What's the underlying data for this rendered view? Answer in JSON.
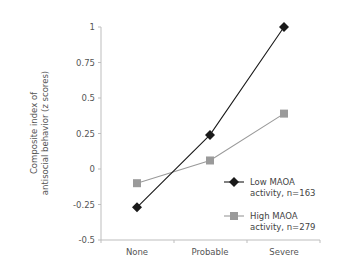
{
  "chart_data": {
    "type": "line",
    "title": "",
    "xlabel": "",
    "ylabel_lines": [
      "Composite index of",
      "antisocial behavior (z scores)"
    ],
    "ylabel": "Composite index of antisocial behavior (z scores)",
    "categories": [
      "None",
      "Probable",
      "Severe"
    ],
    "ylim": [
      -0.5,
      1
    ],
    "yticks": [
      1,
      0.75,
      0.5,
      0.25,
      0,
      -0.25,
      -0.5
    ],
    "ytick_labels": [
      "1",
      "0.75",
      "0.5",
      "0.25",
      "0",
      "-0.25",
      "-0.5"
    ],
    "grid": false,
    "legend_position": "lower right",
    "series": [
      {
        "name": "Low MAOA activity, n=163",
        "legend_lines": [
          "Low MAOA",
          "activity, n=163"
        ],
        "marker": "diamond",
        "color": "#1a1a1a",
        "values": [
          -0.27,
          0.24,
          1.0
        ]
      },
      {
        "name": "High MAOA activity, n=279",
        "legend_lines": [
          "High MAOA",
          "activity, n=279"
        ],
        "marker": "square",
        "color": "#9a9a9a",
        "values": [
          -0.1,
          0.06,
          0.39
        ]
      }
    ]
  }
}
